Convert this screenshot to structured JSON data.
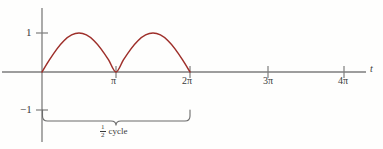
{
  "chart_data": {
    "type": "line",
    "title": "",
    "xlabel": "t",
    "ylabel": "",
    "xlim": [
      -0.35,
      15.0
    ],
    "ylim": [
      -1.6,
      1.6
    ],
    "grid": false,
    "legend": null,
    "x_tick_labels": [
      "π",
      "2π",
      "3π",
      "4π"
    ],
    "x_tick_values": [
      3.1416,
      6.2832,
      9.4248,
      12.5664
    ],
    "y_tick_labels": [
      "1",
      "−1"
    ],
    "y_tick_values": [
      1,
      -1
    ],
    "series": [
      {
        "name": "sin t",
        "color": "#9e2f2a",
        "domain": [
          0,
          6.2832
        ],
        "x": [
          0.0,
          0.3142,
          0.6283,
          0.9425,
          1.2566,
          1.5708,
          1.885,
          2.1991,
          2.5133,
          2.8274,
          3.1416,
          3.4558,
          3.7699,
          4.0841,
          4.3982,
          4.7124,
          5.0265,
          5.3407,
          5.6549,
          5.969,
          6.2832
        ],
        "y": [
          0.0,
          0.309,
          0.5878,
          0.809,
          0.9511,
          1.0,
          0.9511,
          0.809,
          0.5878,
          0.309,
          0.0,
          0.309,
          0.5878,
          0.809,
          0.9511,
          1.0,
          0.9511,
          0.809,
          0.5878,
          0.309,
          0.0
        ],
        "note": "half-rectified / half-cycle arch: one positive hump from 0 to 2π"
      }
    ],
    "annotations": [
      {
        "name": "half-cycle-brace",
        "kind": "brace",
        "from_x": 0,
        "to_x": 6.2832,
        "label_numerator": "1",
        "label_denominator": "2",
        "label_text": "cycle"
      }
    ]
  },
  "labels": {
    "y_one": "1",
    "y_neg_one": "−1",
    "x_pi": "π",
    "x_2pi": "2π",
    "x_3pi": "3π",
    "x_4pi": "4π",
    "t_axis": "t",
    "cycle_numerator": "1",
    "cycle_denominator": "2",
    "cycle_word": "cycle"
  },
  "colors": {
    "curve": "#9e2f2a",
    "axis": "#7d7d7d",
    "text": "#3a3a3a",
    "brace": "#6b6b6b",
    "background": "#fefefd"
  }
}
